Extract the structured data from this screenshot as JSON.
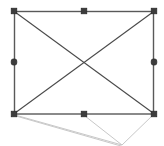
{
  "canvas": {
    "width": 164,
    "height": 146,
    "background_color": "#ffffff",
    "description": "Selected rectangular shape with diagonal cross lines and light gray guide lines"
  },
  "colors": {
    "shape_stroke": "#595959",
    "diagonal_stroke": "#4a4a4a",
    "guide_stroke": "#c8c8c8",
    "handle_fill": "#3c3c3c",
    "handle_stroke": "#2b2b2b",
    "background": "#ffffff"
  },
  "shape": {
    "name": "rectangle",
    "left": 14,
    "top": 11,
    "right": 154,
    "bottom": 114,
    "width": 140,
    "height": 103,
    "stroke_width": 1.4
  },
  "diagonals": [
    {
      "name": "diagonal-top-left-to-bottom-right",
      "x1": 15,
      "y1": 12,
      "x2": 153,
      "y2": 113
    },
    {
      "name": "diagonal-bottom-left-to-top-right",
      "x1": 15,
      "y1": 113,
      "x2": 153,
      "y2": 12
    }
  ],
  "handles": [
    {
      "name": "handle-top-left",
      "x": 14,
      "y": 11,
      "shape": "square",
      "cursor": "nwse-resize"
    },
    {
      "name": "handle-top-center",
      "x": 84,
      "y": 11,
      "shape": "square",
      "cursor": "ns-resize"
    },
    {
      "name": "handle-top-right",
      "x": 154,
      "y": 11,
      "shape": "square",
      "cursor": "nesw-resize"
    },
    {
      "name": "handle-middle-left",
      "x": 14,
      "y": 62,
      "shape": "rounded",
      "cursor": "ew-resize"
    },
    {
      "name": "handle-middle-right",
      "x": 154,
      "y": 62,
      "shape": "rounded",
      "cursor": "ew-resize"
    },
    {
      "name": "handle-bottom-left",
      "x": 14,
      "y": 114,
      "shape": "square",
      "cursor": "nesw-resize"
    },
    {
      "name": "handle-bottom-center",
      "x": 84,
      "y": 114,
      "shape": "square",
      "cursor": "ns-resize"
    },
    {
      "name": "handle-bottom-right",
      "x": 154,
      "y": 114,
      "shape": "square",
      "cursor": "nwse-resize"
    }
  ],
  "guide_lines": [
    {
      "name": "guide-bottom-left-to-vanishing",
      "x1": 15,
      "y1": 115,
      "x2": 122,
      "y2": 145
    },
    {
      "name": "guide-bottom-center-to-vanishing",
      "x1": 85,
      "y1": 116,
      "x2": 122,
      "y2": 145
    },
    {
      "name": "guide-bottom-right-to-vanishing",
      "x1": 153,
      "y1": 115,
      "x2": 122,
      "y2": 145
    },
    {
      "name": "guide-left-sweep-lower",
      "x1": 16,
      "y1": 116,
      "x2": 121,
      "y2": 146
    }
  ],
  "vanishing_point": {
    "name": "perspective-vanishing-point",
    "x": 122,
    "y": 145
  },
  "selection": {
    "active": true,
    "handle_size": 5,
    "handle_count": 8
  }
}
